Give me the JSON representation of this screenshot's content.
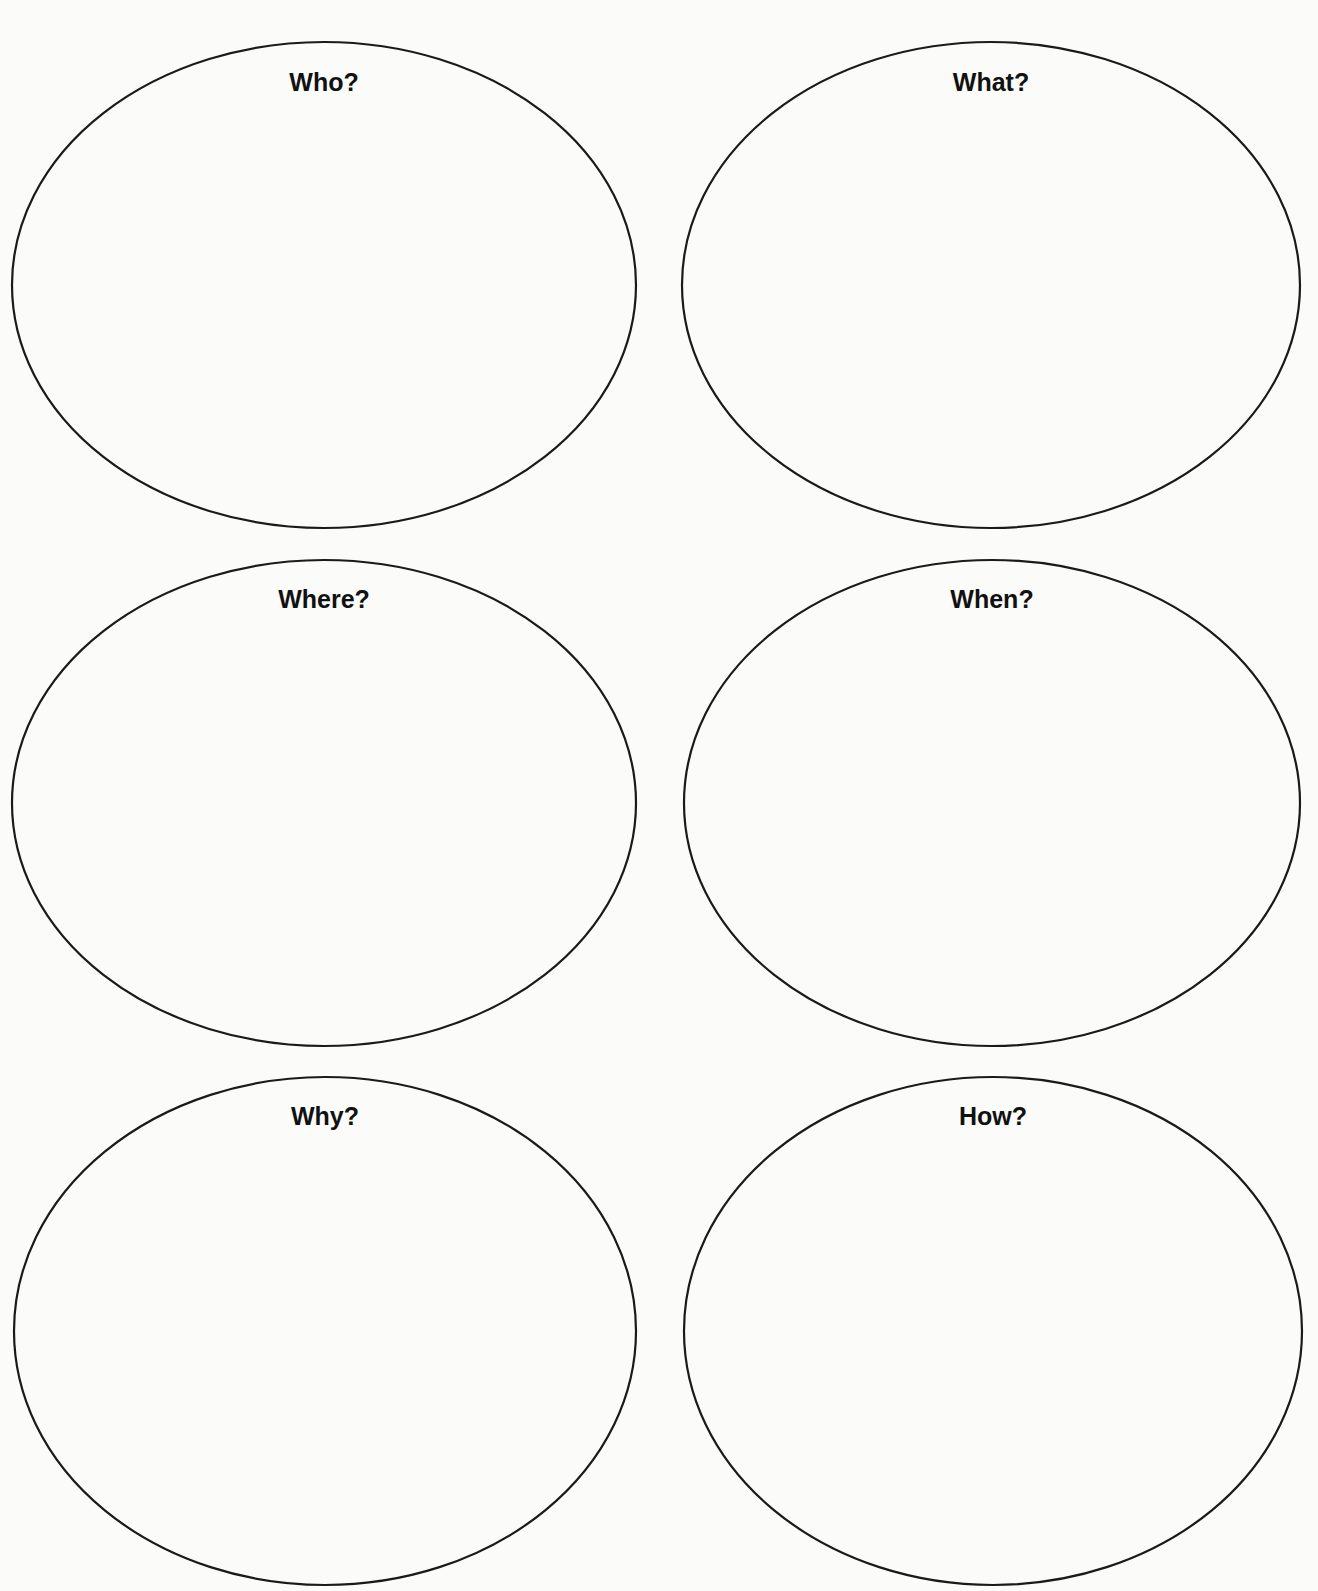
{
  "worksheet": {
    "stroke_color": "#1a1a1a",
    "background_color": "#fbfbfa",
    "ovals": [
      {
        "label": "Who?",
        "cx": 324,
        "cy": 285,
        "rx": 312,
        "ry": 243,
        "label_y": 70
      },
      {
        "label": "What?",
        "cx": 991,
        "cy": 285,
        "rx": 309,
        "ry": 243,
        "label_y": 70
      },
      {
        "label": "Where?",
        "cx": 324,
        "cy": 803,
        "rx": 312,
        "ry": 243,
        "label_y": 587
      },
      {
        "label": "When?",
        "cx": 992,
        "cy": 803,
        "rx": 308,
        "ry": 243,
        "label_y": 587
      },
      {
        "label": "Why?",
        "cx": 325,
        "cy": 1331,
        "rx": 311,
        "ry": 254,
        "label_y": 1104
      },
      {
        "label": "How?",
        "cx": 993,
        "cy": 1331,
        "rx": 309,
        "ry": 254,
        "label_y": 1104
      }
    ]
  }
}
